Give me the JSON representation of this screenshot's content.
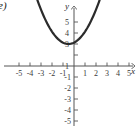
{
  "figure": {
    "part_label": "e)",
    "background_color": "#ffffff",
    "curve_color": "#2b2b2b",
    "axis_color": "#555555"
  },
  "chart_data": {
    "type": "line",
    "title": "",
    "xlabel": "x",
    "ylabel": "y",
    "xlim": [
      -5.8,
      5.8
    ],
    "ylim": [
      -5.8,
      5.8
    ],
    "grid": false,
    "legend": null,
    "x_ticks": [
      -5,
      -4,
      -3,
      -2,
      -1,
      1,
      2,
      3,
      4,
      5
    ],
    "x_tick_labels": [
      "-5",
      "-4",
      "-3",
      "-2",
      "-1",
      "1",
      "2",
      "3",
      "4",
      "5"
    ],
    "y_ticks": [
      5,
      4,
      3,
      1,
      -1,
      -2,
      -3,
      -4,
      -5
    ],
    "y_tick_labels": [
      "5",
      "4",
      "3",
      "1",
      "-1",
      "-2",
      "-3",
      "-4",
      "-5"
    ],
    "y_tick_hidden_by_curve": [
      "2"
    ],
    "series": [
      {
        "name": "parabola",
        "kind": "parabola",
        "equation": "y = 0.5(x + 0.5)^2 + 2",
        "vertex": [
          -0.5,
          2
        ],
        "leading_coefficient": 0.5,
        "opens": "up",
        "x_domain": [
          -4.8,
          3.8
        ],
        "x": [
          -4.8,
          -4.4,
          -4.0,
          -3.6,
          -3.2,
          -2.8,
          -2.4,
          -2.0,
          -1.6,
          -1.2,
          -0.8,
          -0.4,
          0.0,
          0.4,
          0.8,
          1.2,
          1.6,
          2.0,
          2.4,
          2.8,
          3.2,
          3.6,
          3.8
        ],
        "y": [
          11.25,
          9.61,
          8.12,
          6.81,
          5.65,
          4.65,
          3.81,
          3.12,
          2.61,
          2.25,
          2.05,
          2.0,
          2.12,
          2.4,
          2.85,
          3.44,
          4.2,
          5.12,
          6.2,
          7.44,
          8.84,
          10.4,
          11.25
        ]
      }
    ],
    "annotations": [
      {
        "text": "e)",
        "position": "top-left"
      },
      {
        "text": "y",
        "position": "y-axis-top"
      },
      {
        "text": "x",
        "position": "x-axis-right"
      }
    ]
  }
}
